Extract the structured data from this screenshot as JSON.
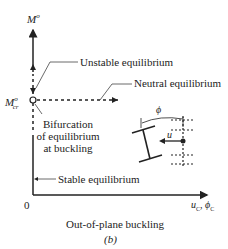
{
  "diagram": {
    "y_axis_label": "M",
    "y_axis_sup": "o",
    "mcr_label": "M",
    "mcr_sup": "o",
    "mcr_sub": "cr",
    "origin_label": "0",
    "x_axis_label_u": "u",
    "x_axis_label_phi": "ϕ",
    "x_axis_sub": "C",
    "x_axis_sep": ", ",
    "annotations": {
      "unstable": "Unstable equilibrium",
      "neutral": "Neutral equilibrium",
      "bifurcation_line1": "Bifurcation",
      "bifurcation_line2": "of equilibrium",
      "bifurcation_line3": "at buckling",
      "stable": "Stable equilibrium"
    },
    "inset": {
      "phi_label": "ϕ",
      "u_label": "u"
    },
    "caption": "Out-of-plane buckling",
    "sub_label": "(b)"
  }
}
